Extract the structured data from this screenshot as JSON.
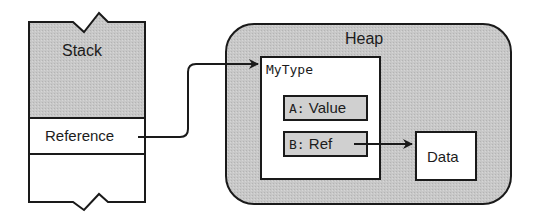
{
  "diagram": {
    "type": "memory-layout",
    "colors": {
      "stroke": "#1a1a1a",
      "shaded_fill": "#c4c4c4",
      "field_fill": "#cfcfcf",
      "plain_fill": "#ffffff"
    },
    "stack": {
      "title": "Stack",
      "slot_label": "Reference"
    },
    "heap": {
      "title": "Heap",
      "object": {
        "type_name": "MyType",
        "fields": [
          {
            "key": "A:",
            "value": "Value"
          },
          {
            "key": "B:",
            "value": "Ref"
          }
        ]
      },
      "data_box": {
        "label": "Data"
      }
    },
    "arrows": [
      {
        "from": "stack.slot_label",
        "to": "heap.object"
      },
      {
        "from": "heap.object.fields.1",
        "to": "heap.data_box"
      }
    ]
  }
}
